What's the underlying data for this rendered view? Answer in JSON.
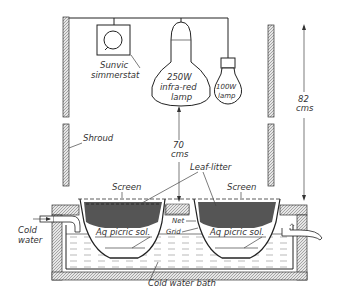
{
  "diagram": {
    "labels": {
      "simmerstat": [
        "Sunvic",
        "simmerstat"
      ],
      "infrared_lamp": [
        "250W",
        "infra-red",
        "lamp"
      ],
      "lamp_100w": [
        "100W",
        "lamp"
      ],
      "height_82": [
        "82",
        "cms"
      ],
      "height_70": [
        "70",
        "cms"
      ],
      "shroud": "Shroud",
      "leaf_litter": "Leaf-litter",
      "screen_left": "Screen",
      "screen_right": "Screen",
      "net": "Net",
      "grid": "Grid",
      "picric_left": "Aq picric sol.",
      "picric_right": "Aq picric sol.",
      "cold_water": [
        "Cold",
        "water"
      ],
      "cold_water_bath": "Cold water bath"
    }
  }
}
